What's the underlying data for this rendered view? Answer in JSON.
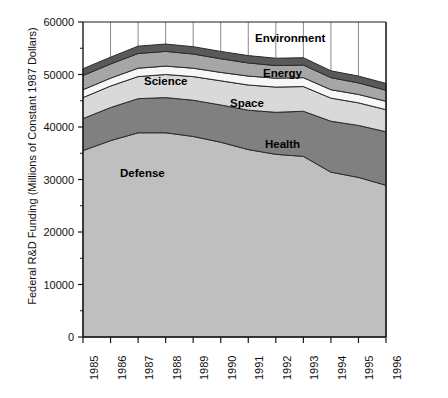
{
  "chart_data": {
    "type": "area",
    "title": "",
    "subtitle": "",
    "xlabel": "",
    "ylabel": "Federal R&D Funding (Millions of Constant 1987 Dollars)",
    "stacked": true,
    "grid": true,
    "legend_position": "inline-labels",
    "xlim": [
      1985,
      1996
    ],
    "ylim": [
      0,
      60000
    ],
    "yticks": [
      0,
      10000,
      20000,
      30000,
      40000,
      50000,
      60000
    ],
    "ytick_labels": [
      "0",
      "10000",
      "20000",
      "30000",
      "40000",
      "50000",
      "60000"
    ],
    "x": [
      1985,
      1986,
      1987,
      1988,
      1989,
      1990,
      1991,
      1992,
      1993,
      1994,
      1995,
      1996
    ],
    "categories": [
      "1985",
      "1986",
      "1987",
      "1988",
      "1989",
      "1990",
      "1991",
      "1992",
      "1993",
      "1994",
      "1995",
      "1996"
    ],
    "series": [
      {
        "name": "Defense",
        "color": "#bfbfbf",
        "values": [
          35500,
          37400,
          38900,
          38900,
          38200,
          37100,
          35700,
          34800,
          34400,
          31400,
          30400,
          28900
        ]
      },
      {
        "name": "Health",
        "color": "#808080",
        "values": [
          6100,
          6300,
          6500,
          6700,
          6900,
          7100,
          7500,
          8000,
          8600,
          9700,
          9900,
          10200
        ]
      },
      {
        "name": "Space",
        "color": "#d9d9d9",
        "values": [
          4000,
          4100,
          4200,
          4400,
          4500,
          4600,
          4800,
          4800,
          4700,
          4400,
          4300,
          4200
        ]
      },
      {
        "name": "Science",
        "color": "#f7f7f7",
        "values": [
          1500,
          1500,
          1600,
          1600,
          1600,
          1600,
          1700,
          1700,
          1700,
          1600,
          1600,
          1600
        ]
      },
      {
        "name": "Energy",
        "color": "#a6a6a6",
        "values": [
          2700,
          2700,
          2800,
          2800,
          2700,
          2600,
          2500,
          2400,
          2400,
          2300,
          2200,
          2100
        ]
      },
      {
        "name": "Environment",
        "color": "#595959",
        "values": [
          1300,
          1300,
          1400,
          1400,
          1400,
          1400,
          1400,
          1400,
          1400,
          1300,
          1300,
          1300
        ]
      }
    ],
    "annotations": [
      {
        "text": "Environment",
        "x": 255,
        "y": 32
      },
      {
        "text": "Energy",
        "x": 263,
        "y": 67
      },
      {
        "text": "Space",
        "x": 230,
        "y": 97
      },
      {
        "text": "Science",
        "x": 144,
        "y": 75
      },
      {
        "text": "Health",
        "x": 265,
        "y": 138
      },
      {
        "text": "Defense",
        "x": 120,
        "y": 167
      }
    ]
  },
  "axes": {
    "ylabel": "Federal R&D Funding (Millions of Constant 1987 Dollars)"
  }
}
